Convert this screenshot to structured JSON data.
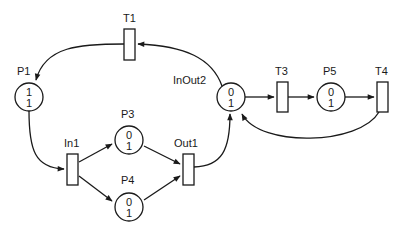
{
  "diagram": {
    "type": "petri-net",
    "colors": {
      "stroke": "#1a1a1a",
      "background": "#ffffff"
    },
    "places": [
      {
        "id": "P1",
        "label": "P1",
        "top": "1",
        "bottom": "1",
        "cx": 29,
        "cy": 97,
        "lx": 17,
        "ly": 75
      },
      {
        "id": "P3",
        "label": "P3",
        "top": "0",
        "bottom": "1",
        "cx": 129,
        "cy": 140,
        "lx": 121,
        "ly": 118
      },
      {
        "id": "P4",
        "label": "P4",
        "top": "0",
        "bottom": "1",
        "cx": 129,
        "cy": 207,
        "lx": 121,
        "ly": 184
      },
      {
        "id": "InOut2",
        "label": "InOut2",
        "top": "0",
        "bottom": "1",
        "cx": 231,
        "cy": 97,
        "lx": 173,
        "ly": 84
      },
      {
        "id": "P5",
        "label": "P5",
        "top": "0",
        "bottom": "1",
        "cx": 331,
        "cy": 97,
        "lx": 323,
        "ly": 75
      }
    ],
    "transitions": [
      {
        "id": "T1",
        "label": "T1",
        "x": 124,
        "y": 29,
        "w": 11,
        "h": 31,
        "lx": 123,
        "ly": 22
      },
      {
        "id": "In1",
        "label": "In1",
        "x": 67,
        "y": 154,
        "w": 11,
        "h": 31,
        "lx": 64,
        "ly": 147
      },
      {
        "id": "Out1",
        "label": "Out1",
        "x": 183,
        "y": 154,
        "w": 11,
        "h": 31,
        "lx": 174,
        "ly": 147
      },
      {
        "id": "T3",
        "label": "T3",
        "x": 277,
        "y": 82,
        "w": 11,
        "h": 30,
        "lx": 275,
        "ly": 75
      },
      {
        "id": "T4",
        "label": "T4",
        "x": 377,
        "y": 82,
        "w": 11,
        "h": 30,
        "lx": 375,
        "ly": 75
      }
    ],
    "arcs": [
      {
        "from": "InOut2",
        "to": "T1",
        "d": "M222,86 C212,58 185,46 138,44"
      },
      {
        "from": "T1",
        "to": "P1",
        "d": "M124,44 C80,44 45,46 36,80"
      },
      {
        "from": "P1",
        "to": "In1",
        "d": "M29,111 C29,150 35,168 64,169"
      },
      {
        "from": "In1",
        "to": "P3",
        "d": "M79,162 L112,144"
      },
      {
        "from": "In1",
        "to": "P4",
        "d": "M79,176 L112,201"
      },
      {
        "from": "P3",
        "to": "Out1",
        "d": "M144,146 L180,164"
      },
      {
        "from": "P4",
        "to": "Out1",
        "d": "M144,200 L180,176"
      },
      {
        "from": "Out1",
        "to": "InOut2",
        "d": "M194,167 C222,166 230,150 230,114"
      },
      {
        "from": "InOut2",
        "to": "T3",
        "d": "M245,97 L274,97"
      },
      {
        "from": "T3",
        "to": "P5",
        "d": "M288,97 L314,97"
      },
      {
        "from": "P5",
        "to": "T4",
        "d": "M345,97 L374,97"
      },
      {
        "from": "T4",
        "to": "InOut2",
        "d": "M379,112 C360,145 260,148 242,114"
      }
    ]
  }
}
